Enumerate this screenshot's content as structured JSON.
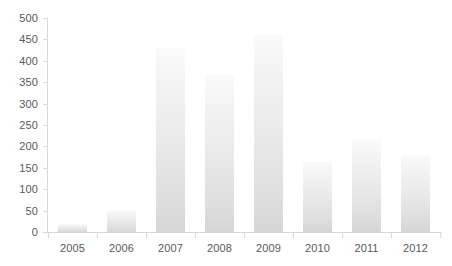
{
  "chart_data": {
    "type": "bar",
    "title": "",
    "subtitle": "",
    "xlabel": "",
    "ylabel": "",
    "categories": [
      "2005",
      "2006",
      "2007",
      "2008",
      "2009",
      "2010",
      "2011",
      "2012"
    ],
    "values": [
      19,
      52,
      430,
      368,
      460,
      167,
      217,
      179
    ],
    "series": [
      {
        "name": "",
        "values": [
          19,
          52,
          430,
          368,
          460,
          167,
          217,
          179
        ]
      }
    ],
    "ylim": [
      0,
      500
    ],
    "yticks": [
      0,
      50,
      100,
      150,
      200,
      250,
      300,
      350,
      400,
      450,
      500
    ],
    "ytick_labels": [
      "0",
      "50",
      "100",
      "150",
      "200",
      "250",
      "300",
      "350",
      "400",
      "450",
      "500"
    ],
    "grid": false,
    "legend": false,
    "legend_position": "none",
    "annotations": [],
    "colors": {
      "bar_top": "#fafafa",
      "bar_bottom": "#d6d6d6",
      "axis": "#d9d9d9",
      "tick_label": "#595959",
      "background": "#ffffff"
    }
  }
}
